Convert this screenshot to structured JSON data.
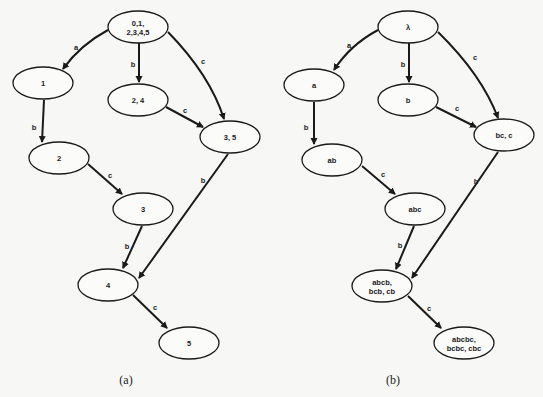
{
  "diagrams": [
    {
      "id": "a",
      "caption": "(a)",
      "nodes": [
        {
          "id": "n0",
          "lines": [
            "0,1,",
            "2,3,4,5"
          ],
          "cx": 138,
          "cy": 27,
          "rx": 30,
          "ry": 16
        },
        {
          "id": "n1",
          "lines": [
            "1"
          ],
          "cx": 43,
          "cy": 83,
          "rx": 30,
          "ry": 16
        },
        {
          "id": "n24",
          "lines": [
            "2, 4"
          ],
          "cx": 138,
          "cy": 100,
          "rx": 30,
          "ry": 16
        },
        {
          "id": "n35",
          "lines": [
            "3, 5"
          ],
          "cx": 230,
          "cy": 137,
          "rx": 30,
          "ry": 16
        },
        {
          "id": "n2",
          "lines": [
            "2"
          ],
          "cx": 59,
          "cy": 158,
          "rx": 30,
          "ry": 16
        },
        {
          "id": "n3",
          "lines": [
            "3"
          ],
          "cx": 143,
          "cy": 209,
          "rx": 30,
          "ry": 16
        },
        {
          "id": "n4",
          "lines": [
            "4"
          ],
          "cx": 108,
          "cy": 285,
          "rx": 30,
          "ry": 16
        },
        {
          "id": "n5",
          "lines": [
            "5"
          ],
          "cx": 189,
          "cy": 343,
          "rx": 30,
          "ry": 16
        }
      ],
      "edges": [
        {
          "from": "n0",
          "to": "n1",
          "label": "a",
          "d": "M108,30 Q80,45 63,69",
          "lx": 76,
          "ly": 47
        },
        {
          "from": "n0",
          "to": "n24",
          "label": "b",
          "d": "M139,43 L139,82",
          "lx": 133,
          "ly": 64
        },
        {
          "from": "n0",
          "to": "n35",
          "label": "c",
          "d": "M168,32 Q210,75 224,119",
          "lx": 203,
          "ly": 61
        },
        {
          "from": "n24",
          "to": "n35",
          "label": "c",
          "d": "M166,107 L203,127",
          "lx": 185,
          "ly": 110
        },
        {
          "from": "n1",
          "to": "n2",
          "label": "b",
          "d": "M44,100 Q43,120 42,142",
          "lx": 34,
          "ly": 127
        },
        {
          "from": "n2",
          "to": "n3",
          "label": "c",
          "d": "M88,164 L122,194",
          "lx": 110,
          "ly": 175
        },
        {
          "from": "n35",
          "to": "n4",
          "label": "b",
          "d": "M228,154 L139,278",
          "lx": 203,
          "ly": 180
        },
        {
          "from": "n3",
          "to": "n4",
          "label": "b",
          "d": "M142,226 L123,268",
          "lx": 127,
          "ly": 246
        },
        {
          "from": "n4",
          "to": "n5",
          "label": "c",
          "d": "M133,295 L167,328",
          "lx": 155,
          "ly": 307
        }
      ],
      "caption_x": 126,
      "caption_y": 384
    },
    {
      "id": "b",
      "caption": "(b)",
      "nodes": [
        {
          "id": "m0",
          "lines": [
            "λ"
          ],
          "cx": 408,
          "cy": 27,
          "rx": 30,
          "ry": 16
        },
        {
          "id": "ma",
          "lines": [
            "a"
          ],
          "cx": 314,
          "cy": 85,
          "rx": 30,
          "ry": 16
        },
        {
          "id": "mb",
          "lines": [
            "b"
          ],
          "cx": 408,
          "cy": 100,
          "rx": 30,
          "ry": 16
        },
        {
          "id": "mbc",
          "lines": [
            "bc, c"
          ],
          "cx": 504,
          "cy": 135,
          "rx": 30,
          "ry": 16
        },
        {
          "id": "mab",
          "lines": [
            "ab"
          ],
          "cx": 332,
          "cy": 160,
          "rx": 30,
          "ry": 16
        },
        {
          "id": "mabc",
          "lines": [
            "abc"
          ],
          "cx": 415,
          "cy": 209,
          "rx": 30,
          "ry": 16
        },
        {
          "id": "mabcb",
          "lines": [
            "abcb,",
            "bcb, cb"
          ],
          "cx": 382,
          "cy": 286,
          "rx": 30,
          "ry": 16
        },
        {
          "id": "mabcbc",
          "lines": [
            "abcbc,",
            "bcbc, cbc"
          ],
          "cx": 464,
          "cy": 343,
          "rx": 30,
          "ry": 16
        }
      ],
      "edges": [
        {
          "from": "m0",
          "to": "ma",
          "label": "a",
          "d": "M378,30 Q350,45 334,70",
          "lx": 349,
          "ly": 45
        },
        {
          "from": "m0",
          "to": "mb",
          "label": "b",
          "d": "M409,43 L409,82",
          "lx": 403,
          "ly": 64
        },
        {
          "from": "m0",
          "to": "mbc",
          "label": "c",
          "d": "M438,32 Q482,75 498,118",
          "lx": 475,
          "ly": 57
        },
        {
          "from": "mb",
          "to": "mbc",
          "label": "c",
          "d": "M436,107 L476,127",
          "lx": 457,
          "ly": 108
        },
        {
          "from": "ma",
          "to": "mab",
          "label": "b",
          "d": "M314,102 L314,144",
          "lx": 306,
          "ly": 127
        },
        {
          "from": "mab",
          "to": "mabc",
          "label": "c",
          "d": "M362,166 L395,194",
          "lx": 383,
          "ly": 174
        },
        {
          "from": "mbc",
          "to": "mabcb",
          "label": "b",
          "d": "M498,152 L412,278",
          "lx": 476,
          "ly": 181
        },
        {
          "from": "mabc",
          "to": "mabcb",
          "label": "b",
          "d": "M414,226 L396,269",
          "lx": 400,
          "ly": 245
        },
        {
          "from": "mabcb",
          "to": "mabcbc",
          "label": "c",
          "d": "M408,296 L441,328",
          "lx": 429,
          "ly": 308
        }
      ],
      "caption_x": 393,
      "caption_y": 384
    }
  ]
}
